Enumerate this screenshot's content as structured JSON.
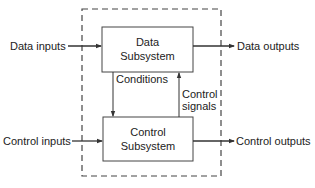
{
  "diagram": {
    "type": "block-diagram",
    "boundary": {
      "style": "dashed",
      "color": "#333333"
    },
    "blocks": [
      {
        "id": "data-subsystem",
        "lines": [
          "Data",
          "Subsystem"
        ]
      },
      {
        "id": "control-subsystem",
        "lines": [
          "Control",
          "Subsystem"
        ]
      }
    ],
    "labels": {
      "data_inputs": "Data inputs",
      "data_outputs": "Data outputs",
      "control_inputs": "Control inputs",
      "control_outputs": "Control outputs",
      "conditions": "Conditions",
      "control_signals_line1": "Control",
      "control_signals_line2": "signals"
    },
    "edges": [
      {
        "from": "Data inputs",
        "to": "data-subsystem"
      },
      {
        "from": "data-subsystem",
        "to": "Data outputs"
      },
      {
        "from": "Control inputs",
        "to": "control-subsystem"
      },
      {
        "from": "control-subsystem",
        "to": "Control outputs"
      },
      {
        "from": "data-subsystem",
        "to": "control-subsystem",
        "label": "Conditions"
      },
      {
        "from": "control-subsystem",
        "to": "data-subsystem",
        "label": "Control signals"
      }
    ],
    "line_color": "#333333"
  }
}
